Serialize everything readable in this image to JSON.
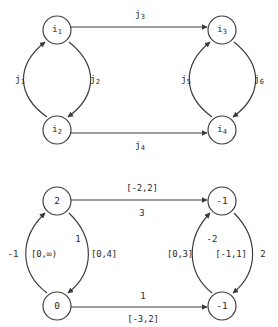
{
  "figure": {
    "type": "two-panel directed graph diagram",
    "panels": [
      {
        "id": "top-graph",
        "description": "Directed graph with symbolic node names and symbolic arc names",
        "nodes": [
          {
            "id": "n1",
            "label": "i",
            "sub": "1",
            "x": 57,
            "y": 30
          },
          {
            "id": "n2",
            "label": "i",
            "sub": "2",
            "x": 57,
            "y": 130
          },
          {
            "id": "n3",
            "label": "i",
            "sub": "3",
            "x": 222,
            "y": 30
          },
          {
            "id": "n4",
            "label": "i",
            "sub": "4",
            "x": 222,
            "y": 130
          }
        ],
        "edges": [
          {
            "id": "e1",
            "label": "j",
            "sub": "1",
            "from": "n2",
            "to": "n1",
            "shape": "arc-left",
            "label_x": 20,
            "label_y": 80
          },
          {
            "id": "e2",
            "label": "j",
            "sub": "2",
            "from": "n1",
            "to": "n2",
            "shape": "arc-right",
            "label_x": 95,
            "label_y": 80
          },
          {
            "id": "e3",
            "label": "j",
            "sub": "3",
            "from": "n1",
            "to": "n3",
            "shape": "straight",
            "label_x": 140,
            "label_y": 15
          },
          {
            "id": "e4",
            "label": "j",
            "sub": "4",
            "from": "n2",
            "to": "n4",
            "shape": "straight",
            "label_x": 140,
            "label_y": 146
          },
          {
            "id": "e5",
            "label": "j",
            "sub": "5",
            "from": "n4",
            "to": "n3",
            "shape": "arc-left",
            "label_x": 186,
            "label_y": 80
          },
          {
            "id": "e6",
            "label": "j",
            "sub": "6",
            "from": "n3",
            "to": "n4",
            "shape": "arc-right",
            "label_x": 259,
            "label_y": 80
          }
        ]
      },
      {
        "id": "bottom-graph",
        "description": "Same graph topology with numeric node potentials and interval capacity / cost arc labels",
        "nodes": [
          {
            "id": "m1",
            "label": "2",
            "x": 57,
            "y": 201
          },
          {
            "id": "m2",
            "label": "0",
            "x": 57,
            "y": 306
          },
          {
            "id": "m3",
            "label": "-1",
            "x": 222,
            "y": 201
          },
          {
            "id": "m4",
            "label": "-1",
            "x": 222,
            "y": 306
          }
        ],
        "edges": [
          {
            "id": "f1",
            "from": "m2",
            "to": "m1",
            "shape": "arc-left",
            "labels": [
              {
                "text": "-1",
                "kind": "cost",
                "x": 13,
                "y": 254
              },
              {
                "text": "[0,∞)",
                "kind": "interval",
                "x": 44,
                "y": 254
              }
            ]
          },
          {
            "id": "f2",
            "from": "m1",
            "to": "m2",
            "shape": "arc-right",
            "labels": [
              {
                "text": "1",
                "kind": "cost",
                "x": 78,
                "y": 239
              },
              {
                "text": "[0,4]",
                "kind": "interval",
                "x": 104,
                "y": 254
              }
            ]
          },
          {
            "id": "f3",
            "from": "m1",
            "to": "m3",
            "shape": "straight",
            "labels": [
              {
                "text": "[-2,2]",
                "kind": "interval",
                "x": 142,
                "y": 188
              },
              {
                "text": "3",
                "kind": "cost",
                "x": 142,
                "y": 213
              }
            ]
          },
          {
            "id": "f4",
            "from": "m2",
            "to": "m4",
            "shape": "straight",
            "labels": [
              {
                "text": "1",
                "kind": "cost",
                "x": 143,
                "y": 296
              },
              {
                "text": "[-3,2]",
                "kind": "interval",
                "x": 143,
                "y": 319
              }
            ]
          },
          {
            "id": "f5",
            "from": "m4",
            "to": "m3",
            "shape": "arc-left",
            "labels": [
              {
                "text": "[0,3]",
                "kind": "interval",
                "x": 180,
                "y": 254
              }
            ]
          },
          {
            "id": "f6",
            "from": "m3",
            "to": "m4",
            "shape": "arc-right",
            "labels": [
              {
                "text": "-2",
                "kind": "cost",
                "x": 212,
                "y": 239
              },
              {
                "text": "[-1,1]",
                "kind": "interval",
                "x": 231,
                "y": 254
              },
              {
                "text": "2",
                "kind": "cost",
                "x": 263,
                "y": 254
              }
            ]
          }
        ]
      }
    ],
    "colors": {
      "stroke": "#3a3a3a",
      "text": "#2b2b2b",
      "background": "#ffffff"
    }
  }
}
